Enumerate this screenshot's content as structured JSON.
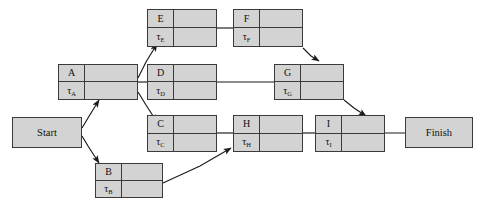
{
  "diagram": {
    "type": "pert-activity-on-node",
    "colors": {
      "node_fill": "#d3d3d3",
      "node_border": "#3a3a3a",
      "edge": "#1a1a1a",
      "background": "#ffffff"
    },
    "terminals": {
      "start": {
        "label": "Start"
      },
      "finish": {
        "label": "Finish"
      }
    },
    "activities": [
      {
        "id": "A",
        "label": "A",
        "duration_symbol": "τ",
        "duration_subscript": "A"
      },
      {
        "id": "B",
        "label": "B",
        "duration_symbol": "τ",
        "duration_subscript": "B"
      },
      {
        "id": "C",
        "label": "C",
        "duration_symbol": "τ",
        "duration_subscript": "C"
      },
      {
        "id": "D",
        "label": "D",
        "duration_symbol": "τ",
        "duration_subscript": "D"
      },
      {
        "id": "E",
        "label": "E",
        "duration_symbol": "τ",
        "duration_subscript": "E"
      },
      {
        "id": "F",
        "label": "F",
        "duration_symbol": "τ",
        "duration_subscript": "F"
      },
      {
        "id": "G",
        "label": "G",
        "duration_symbol": "τ",
        "duration_subscript": "G"
      },
      {
        "id": "H",
        "label": "H",
        "duration_symbol": "τ",
        "duration_subscript": "H"
      },
      {
        "id": "I",
        "label": "I",
        "duration_symbol": "τ",
        "duration_subscript": "I"
      }
    ],
    "edges": [
      {
        "from": "Start",
        "to": "A"
      },
      {
        "from": "Start",
        "to": "B"
      },
      {
        "from": "A",
        "to": "E"
      },
      {
        "from": "A",
        "to": "D"
      },
      {
        "from": "A",
        "to": "C"
      },
      {
        "from": "E",
        "to": "F"
      },
      {
        "from": "F",
        "to": "G"
      },
      {
        "from": "D",
        "to": "G"
      },
      {
        "from": "C",
        "to": "H"
      },
      {
        "from": "B",
        "to": "H"
      },
      {
        "from": "H",
        "to": "I"
      },
      {
        "from": "G",
        "to": "I"
      },
      {
        "from": "I",
        "to": "Finish"
      }
    ]
  }
}
